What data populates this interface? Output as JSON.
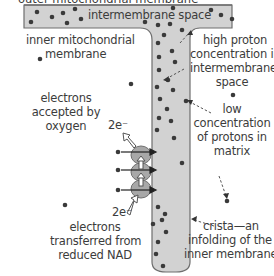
{
  "diagram": {
    "title_cut": "outer mitochondrial membrane",
    "labels": {
      "intermembrane_space": "intermembrane space",
      "inner_membrane_line1": "inner mitochondrial",
      "inner_membrane_line2": "membrane",
      "high_proton_line1": "high proton",
      "high_proton_line2": "concentration in",
      "high_proton_line3": "intermembrane",
      "high_proton_line4": "space",
      "electrons_accepted_line1": "electrons",
      "electrons_accepted_line2": "accepted by",
      "electrons_accepted_line3": "oxygen",
      "two_e_top": "2e⁻",
      "low_conc_line1": "low",
      "low_conc_line2": "concentration",
      "low_conc_line3": "of protons in",
      "low_conc_line4": "matrix",
      "two_e_bottom": "2e⁻",
      "electrons_transferred_line1": "electrons",
      "electrons_transferred_line2": "transferred from",
      "electrons_transferred_line3": "reduced NAD",
      "crista_line1": "crista—an",
      "crista_line2": "infolding of the",
      "crista_line3": "inner membrane"
    },
    "colors": {
      "membrane_fill": "#d2d2d2",
      "membrane_stroke": "#6e6e6e",
      "proton_dot": "#3a3a3a",
      "protein_fill": "#a8a8a8",
      "text": "#3c3c3c"
    },
    "protein_complexes": 3,
    "electron_count": "2e⁻"
  }
}
